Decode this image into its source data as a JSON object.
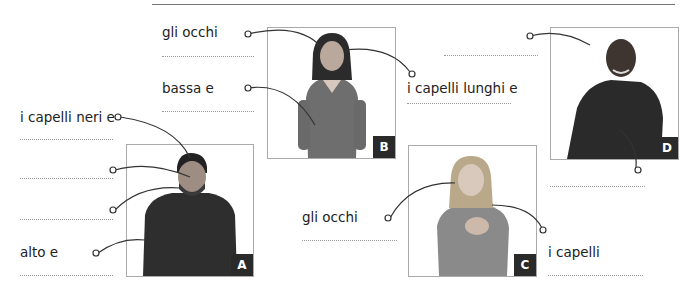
{
  "exercise": {
    "labels": [
      {
        "id": "b-eyes",
        "text": "gli occhi"
      },
      {
        "id": "b-short",
        "text": "bassa e"
      },
      {
        "id": "b-hair",
        "text": "i capelli lunghi e"
      },
      {
        "id": "a-hair",
        "text": "i capelli neri e"
      },
      {
        "id": "a-tall",
        "text": "alto e"
      },
      {
        "id": "c-eyes",
        "text": "gli occhi"
      },
      {
        "id": "c-hair",
        "text": "i capelli"
      }
    ],
    "photos": [
      {
        "id": "A",
        "badge": "A"
      },
      {
        "id": "B",
        "badge": "B"
      },
      {
        "id": "C",
        "badge": "C"
      },
      {
        "id": "D",
        "badge": "D"
      }
    ],
    "colors": {
      "badge": "#2a2a2a",
      "line": "#333333",
      "dots": "#999999"
    }
  }
}
